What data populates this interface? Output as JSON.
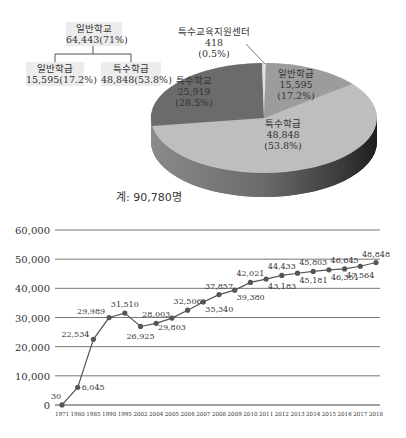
{
  "tree": {
    "root": {
      "label": "일반학교",
      "value": "64,443(71%)"
    },
    "children": [
      {
        "label": "일반학급",
        "value": "15,595(17.2%)"
      },
      {
        "label": "특수학급",
        "value": "48,848(53.8%)"
      }
    ]
  },
  "pie": {
    "callout": {
      "label": "특수교육지원센터",
      "value": "418",
      "pct": "(0.5%)"
    },
    "slices": [
      {
        "label": "일반학급",
        "value": "15,595",
        "pct": "(17.2%)",
        "color": "#9c9c9c"
      },
      {
        "label": "특수학급",
        "value": "48,848",
        "pct": "(53.8%)",
        "color": "#bebebe"
      },
      {
        "label": "특수학교",
        "value": "25,919",
        "pct": "(28.5%)",
        "color": "#6b6b6b"
      }
    ],
    "total": "계: 90,780명"
  },
  "chart_data": [
    {
      "type": "pie",
      "title": "",
      "categories": [
        "특수학교",
        "일반학급",
        "특수학급",
        "특수교육지원센터"
      ],
      "values": [
        25919,
        15595,
        48848,
        418
      ],
      "percent_labels": [
        "28.5%",
        "17.2%",
        "53.8%",
        "0.5%"
      ],
      "annotations": [
        "계: 90,780명",
        "일반학교 64,443(71%)",
        "일반학급 15,595(17.2%)",
        "특수학급 48,848(53.8%)"
      ],
      "style": "3d"
    },
    {
      "type": "line",
      "title": "",
      "xlabel": "",
      "ylabel": "",
      "x": [
        "1971",
        "1980",
        "1985",
        "1990",
        "1995",
        "2002",
        "2004",
        "2005",
        "2006",
        "2007",
        "2008",
        "2009",
        "2010",
        "2011",
        "2012",
        "2013",
        "2014",
        "2015",
        "2016",
        "2017",
        "2018"
      ],
      "values": [
        30,
        6045,
        22534,
        29989,
        31510,
        26925,
        28003,
        29803,
        32506,
        35340,
        37857,
        39380,
        42021,
        43183,
        44433,
        45181,
        45803,
        46351,
        46645,
        47564,
        48848
      ],
      "data_labels": [
        "30",
        "6,045",
        "22,534",
        "29,989",
        "31,510",
        "26,925",
        "28,003",
        "29,803",
        "32,506",
        "35,340",
        "37,857",
        "39,380",
        "42,021",
        "43,183",
        "44,433",
        "45,181",
        "45,803",
        "46,351",
        "46,645",
        "47,564",
        "48,848"
      ],
      "yticks": [
        "0",
        "10,000",
        "20,000",
        "30,000",
        "40,000",
        "50,000",
        "60,000"
      ],
      "ylim": [
        0,
        60000
      ],
      "grid": true,
      "legend": "none"
    }
  ]
}
